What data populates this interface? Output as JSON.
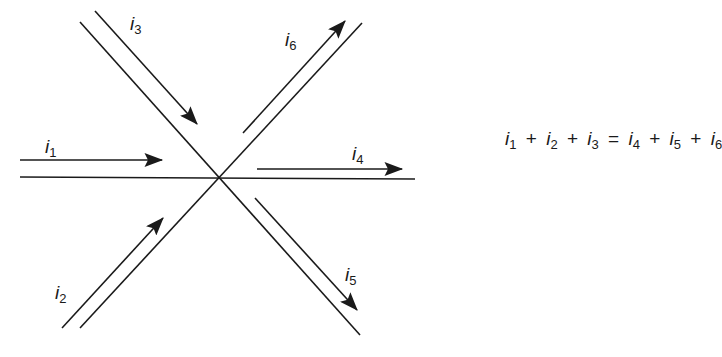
{
  "diagram": {
    "node": {
      "x": 219,
      "y": 177
    },
    "currents": [
      {
        "id": "i1",
        "symbol": "i",
        "subscript": "1",
        "direction": "into node"
      },
      {
        "id": "i2",
        "symbol": "i",
        "subscript": "2",
        "direction": "into node"
      },
      {
        "id": "i3",
        "symbol": "i",
        "subscript": "3",
        "direction": "into node"
      },
      {
        "id": "i4",
        "symbol": "i",
        "subscript": "4",
        "direction": "out of node"
      },
      {
        "id": "i5",
        "symbol": "i",
        "subscript": "5",
        "direction": "out of node"
      },
      {
        "id": "i6",
        "symbol": "i",
        "subscript": "6",
        "direction": "out of node"
      }
    ],
    "equation": {
      "terms": [
        {
          "symbol": "i",
          "subscript": "1"
        },
        {
          "op": "+"
        },
        {
          "symbol": "i",
          "subscript": "2"
        },
        {
          "op": "+"
        },
        {
          "symbol": "i",
          "subscript": "3"
        },
        {
          "op": "="
        },
        {
          "symbol": "i",
          "subscript": "4"
        },
        {
          "op": "+"
        },
        {
          "symbol": "i",
          "subscript": "5"
        },
        {
          "op": "+"
        },
        {
          "symbol": "i",
          "subscript": "6"
        }
      ]
    },
    "colors": {
      "stroke": "#1a1a1a",
      "background": "#ffffff"
    }
  }
}
